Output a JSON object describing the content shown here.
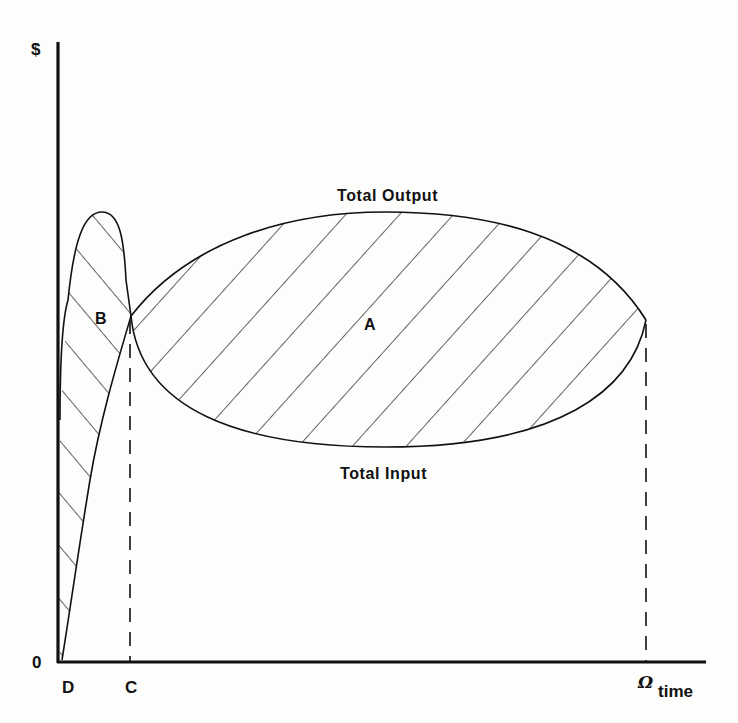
{
  "diagram": {
    "type": "economic-diagram",
    "axes": {
      "y_label": "$",
      "x_label": "time",
      "origin_label": "0"
    },
    "x_markers": [
      {
        "id": "D",
        "label": "D",
        "x_px": 62
      },
      {
        "id": "C",
        "label": "C",
        "x_px": 130
      },
      {
        "id": "omega",
        "label": "Ω",
        "x_px": 646
      }
    ],
    "curves": [
      {
        "id": "total-output",
        "label": "Total Output"
      },
      {
        "id": "total-input",
        "label": "Total Input"
      }
    ],
    "regions": [
      {
        "id": "A",
        "label": "A",
        "description": "hatched area between Total Output and Total Input from C to Ω"
      },
      {
        "id": "B",
        "label": "B",
        "description": "hatched area between Total Input and Total Output from D to C"
      }
    ],
    "colors": {
      "ink": "#111111",
      "paper": "#fdfdfc"
    }
  }
}
